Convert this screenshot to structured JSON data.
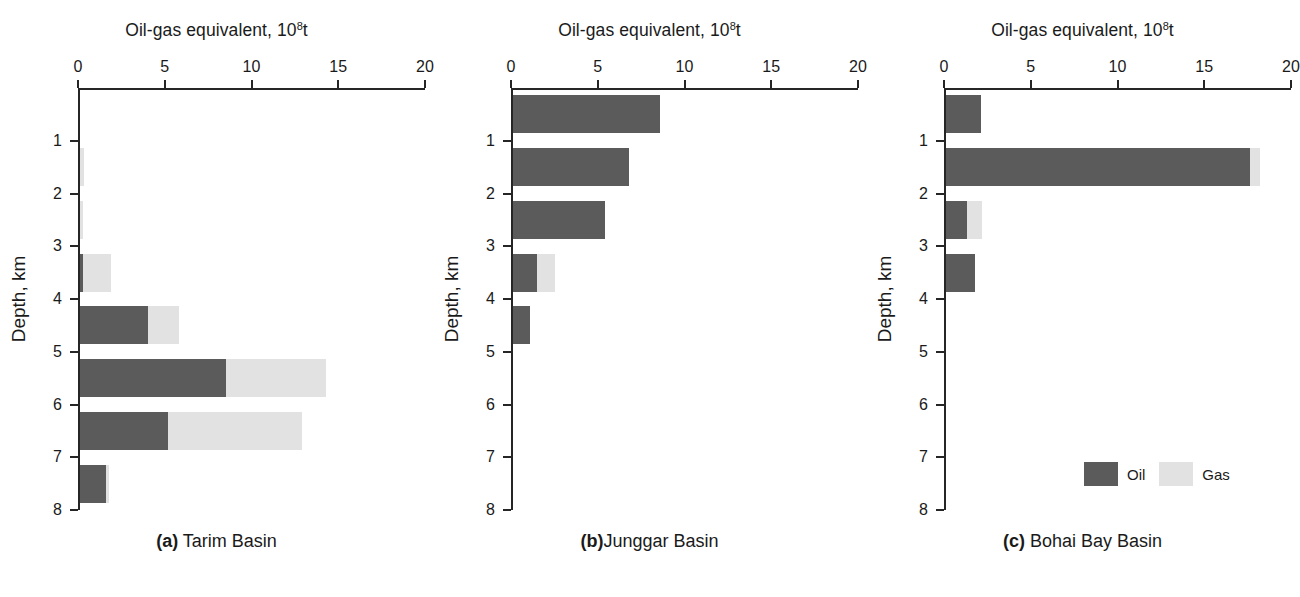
{
  "figure": {
    "axis_title_text": "Oil-gas equivalent, 10",
    "axis_title_exponent": "8",
    "axis_title_suffix": "t",
    "y_axis_caption": "Depth, km",
    "x_ticks": [
      "0",
      "5",
      "10",
      "15",
      "20"
    ],
    "y_ticks": [
      "1",
      "2",
      "3",
      "4",
      "5",
      "6",
      "7",
      "8"
    ],
    "legend": {
      "oil_label": "Oil",
      "gas_label": "Gas",
      "oil_color": "#5b5b5b",
      "gas_color": "#e2e2e2"
    },
    "panels": [
      {
        "tag": "(a)",
        "name": " Tarim Basin"
      },
      {
        "tag": "(b)",
        "name": "Junggar Basin"
      },
      {
        "tag": "(c)",
        "name": " Bohai Bay Basin"
      }
    ]
  },
  "chart_data": [
    {
      "type": "bar",
      "orientation": "horizontal",
      "title": "Oil-gas equivalent, 10^8 t",
      "panel": "(a) Tarim Basin",
      "xlabel": "Oil-gas equivalent, 10^8t",
      "ylabel": "Depth, km",
      "xlim": [
        0,
        20
      ],
      "ylim": [
        0,
        8
      ],
      "grid": false,
      "legend_position": "figure-bottom-right",
      "stacked": true,
      "categories": [
        "0-1",
        "1-2",
        "2-3",
        "3-4",
        "4-5",
        "5-6",
        "6-7",
        "7-8"
      ],
      "series": [
        {
          "name": "Oil",
          "color": "#5b5b5b",
          "values": [
            0.0,
            0.0,
            0.0,
            0.15,
            3.9,
            8.4,
            5.1,
            1.5
          ]
        },
        {
          "name": "Gas",
          "color": "#e2e2e2",
          "values": [
            0.0,
            0.25,
            0.2,
            1.65,
            1.8,
            5.8,
            7.7,
            0.2
          ]
        }
      ]
    },
    {
      "type": "bar",
      "orientation": "horizontal",
      "title": "Oil-gas equivalent, 10^8 t",
      "panel": "(b) Junggar Basin",
      "xlabel": "Oil-gas equivalent, 10^8t",
      "ylabel": "Depth, km",
      "xlim": [
        0,
        20
      ],
      "ylim": [
        0,
        8
      ],
      "grid": false,
      "stacked": true,
      "categories": [
        "0-1",
        "1-2",
        "2-3",
        "3-4",
        "4-5",
        "5-6",
        "6-7",
        "7-8"
      ],
      "series": [
        {
          "name": "Oil",
          "color": "#5b5b5b",
          "values": [
            8.5,
            6.7,
            5.3,
            1.4,
            1.0,
            0.0,
            0.0,
            0.0
          ]
        },
        {
          "name": "Gas",
          "color": "#e2e2e2",
          "values": [
            0.0,
            0.0,
            0.0,
            1.0,
            0.0,
            0.0,
            0.0,
            0.0
          ]
        }
      ]
    },
    {
      "type": "bar",
      "orientation": "horizontal",
      "title": "Oil-gas equivalent, 10^8 t",
      "panel": "(c) Bohai Bay Basin",
      "xlabel": "Oil-gas equivalent, 10^8t",
      "ylabel": "Depth, km",
      "xlim": [
        0,
        20
      ],
      "ylim": [
        0,
        8
      ],
      "grid": false,
      "stacked": true,
      "categories": [
        "0-1",
        "1-2",
        "2-3",
        "3-4",
        "4-5",
        "5-6",
        "6-7",
        "7-8"
      ],
      "series": [
        {
          "name": "Oil",
          "color": "#5b5b5b",
          "values": [
            2.0,
            17.5,
            1.2,
            1.7,
            0.0,
            0.0,
            0.0,
            0.0
          ]
        },
        {
          "name": "Gas",
          "color": "#e2e2e2",
          "values": [
            0.0,
            0.6,
            0.9,
            0.0,
            0.0,
            0.0,
            0.0,
            0.0
          ]
        }
      ]
    }
  ]
}
